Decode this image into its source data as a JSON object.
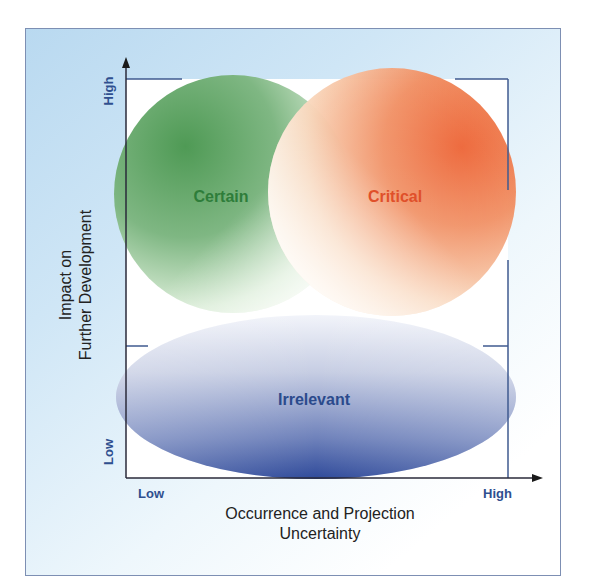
{
  "diagram": {
    "type": "2x2 uncertainty-impact matrix",
    "regions": {
      "certain": {
        "label": "Certain",
        "color": "#2e7d3a",
        "fill": "#5aa35e"
      },
      "critical": {
        "label": "Critical",
        "color": "#e0502a",
        "fill": "#ef6a3a"
      },
      "irrelevant": {
        "label": "Irrelevant",
        "color": "#2b4a8c",
        "fill": "#3c5aa8"
      }
    },
    "y_axis": {
      "title_line1": "Impact on",
      "title_line2": "Further Development",
      "high_label": "High",
      "low_label": "Low"
    },
    "x_axis": {
      "title_line1": "Occurrence and Projection",
      "title_line2": "Uncertainty",
      "low_label": "Low",
      "high_label": "High"
    },
    "colors": {
      "frame_border": "#7d8fb3",
      "axis": "#2a2a3a",
      "box_line": "#3f5a8f",
      "tick_label": "#2f4f8f"
    }
  }
}
